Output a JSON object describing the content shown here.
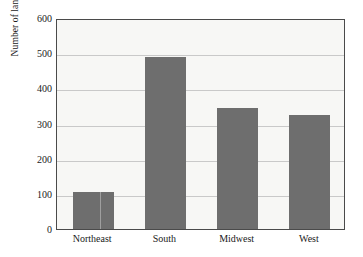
{
  "chart_data": {
    "type": "bar",
    "title": "",
    "xlabel": "",
    "ylabel": "Number of landfills",
    "categories": [
      "Northeast",
      "South",
      "Midwest",
      "West"
    ],
    "values": [
      105,
      490,
      343,
      323
    ],
    "ylim": [
      0,
      600
    ],
    "yticks": [
      0,
      100,
      200,
      300,
      400,
      500,
      600
    ],
    "ytick_labels": [
      "0",
      "100",
      "200",
      "300",
      "400",
      "500",
      "600"
    ],
    "grid": "horizontal",
    "legend": "none",
    "bar_color": "#6e6e6e",
    "plot_background": "#f7f7f5",
    "frame_color": "#4a4a4a",
    "gridline_color": "#c9c9c9",
    "figure_background": "#ffffff"
  }
}
